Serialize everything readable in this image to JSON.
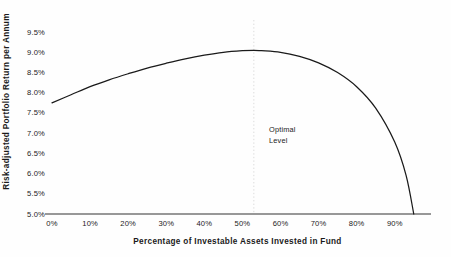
{
  "chart_data": {
    "type": "line",
    "title": "",
    "xlabel": "Percentage of Investable Assets Invested in Fund",
    "ylabel": "Risk-adjusted Portfolio Return per Annum",
    "x_tick_labels": [
      "0%",
      "10%",
      "20%",
      "30%",
      "40%",
      "50%",
      "60%",
      "70%",
      "80%",
      "90%"
    ],
    "x_tick_values": [
      0,
      10,
      20,
      30,
      40,
      50,
      60,
      70,
      80,
      90
    ],
    "y_tick_labels": [
      "9.5%",
      "9.0%",
      "8.5%",
      "8.0%",
      "7.5%",
      "7.0%",
      "6.5%",
      "6.0%",
      "5.5%",
      "5.0%"
    ],
    "y_tick_values": [
      9.5,
      9.0,
      8.5,
      8.0,
      7.5,
      7.0,
      6.5,
      6.0,
      5.5,
      5.0
    ],
    "xlim": [
      0,
      99
    ],
    "ylim": [
      5.0,
      9.75
    ],
    "grid": false,
    "legend": false,
    "series": [
      {
        "name": "Risk-adjusted portfolio return",
        "color": "#1a1a1a",
        "x": [
          0,
          5,
          10,
          15,
          20,
          25,
          30,
          35,
          40,
          45,
          50,
          53,
          55,
          60,
          65,
          70,
          75,
          80,
          85,
          90,
          93,
          95
        ],
        "values": [
          7.75,
          7.95,
          8.15,
          8.32,
          8.47,
          8.61,
          8.73,
          8.84,
          8.93,
          9.0,
          9.04,
          9.05,
          9.04,
          9.0,
          8.9,
          8.74,
          8.5,
          8.15,
          7.62,
          6.78,
          5.95,
          5.0
        ]
      }
    ],
    "annotations": [
      {
        "label": "Optimal\nLevel",
        "marker": "vertical-dotted-line",
        "x": 53,
        "marker_color": "#dcdcdc",
        "label_x": 57,
        "label_y": 7.05
      }
    ]
  },
  "axis_color": "#333333",
  "background_color": "#fefefe"
}
